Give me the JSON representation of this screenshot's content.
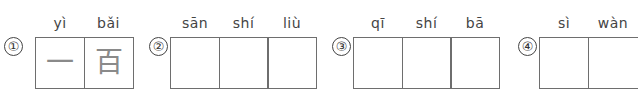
{
  "exercise": {
    "groups": [
      {
        "number": "①",
        "cells": [
          {
            "pinyin": "yì",
            "hanzi": "一"
          },
          {
            "pinyin": "bǎi",
            "hanzi": "百"
          }
        ]
      },
      {
        "number": "②",
        "cells": [
          {
            "pinyin": "sān",
            "hanzi": ""
          },
          {
            "pinyin": "shí",
            "hanzi": ""
          },
          {
            "pinyin": "liù",
            "hanzi": ""
          }
        ]
      },
      {
        "number": "③",
        "cells": [
          {
            "pinyin": "qī",
            "hanzi": ""
          },
          {
            "pinyin": "shí",
            "hanzi": ""
          },
          {
            "pinyin": "bā",
            "hanzi": ""
          }
        ]
      },
      {
        "number": "④",
        "cells": [
          {
            "pinyin": "sì",
            "hanzi": ""
          },
          {
            "pinyin": "wàn",
            "hanzi": ""
          }
        ]
      }
    ]
  }
}
